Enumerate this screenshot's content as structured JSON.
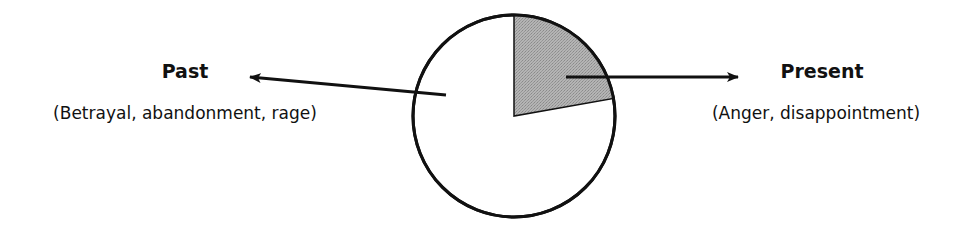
{
  "diagram": {
    "type": "pie-with-callouts",
    "circle": {
      "cx": 514,
      "cy": 116,
      "r": 101,
      "stroke": "#111111",
      "fill": "#ffffff"
    },
    "wedge": {
      "start_deg": 0,
      "end_deg": 80,
      "fill": "#a9a9a9"
    },
    "labels": {
      "past": {
        "title": "Past",
        "subtitle": "(Betrayal, abandonment, rage)"
      },
      "present": {
        "title": "Present",
        "subtitle": "(Anger, disappointment)"
      }
    }
  },
  "chart_data": {
    "type": "pie",
    "title": "",
    "categories": [
      "Present",
      "Past"
    ],
    "values": [
      22,
      78
    ],
    "annotations": [
      "(Anger, disappointment)",
      "(Betrayal, abandonment, rage)"
    ],
    "colors": [
      "#a9a9a9",
      "#ffffff"
    ]
  }
}
